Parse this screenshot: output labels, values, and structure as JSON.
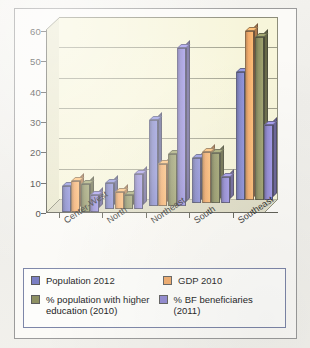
{
  "chart_data": {
    "type": "bar",
    "title": "",
    "xlabel": "",
    "ylabel": "",
    "ylim": [
      0,
      60
    ],
    "yticks": [
      0,
      10,
      20,
      30,
      40,
      50,
      60
    ],
    "grid": true,
    "legend_position": "bottom",
    "categories": [
      "Center-West",
      "North",
      "Northeast",
      "South",
      "Southeast"
    ],
    "series": [
      {
        "name": "Population 2012",
        "color": "#7b7fc4",
        "values": [
          8.5,
          8.5,
          28.5,
          15,
          42.5
        ]
      },
      {
        "name": "GDP 2010",
        "color": "#f0a868",
        "values": [
          10,
          5.5,
          14,
          17,
          56
        ]
      },
      {
        "name": "% population with higher education (2010)",
        "color": "#8e9163",
        "values": [
          9,
          4.5,
          17,
          16.5,
          54
        ]
      },
      {
        "name": "% BF beneficiaries (2011)",
        "color": "#8e86d0",
        "values": [
          5.5,
          11.5,
          52,
          8.5,
          25
        ]
      }
    ]
  },
  "legend": {
    "items": [
      {
        "label": "Population 2012",
        "color": "#7b7fc4"
      },
      {
        "label": "GDP 2010",
        "color": "#f0a868"
      },
      {
        "label": "% population with higher education (2010)",
        "color": "#8e9163"
      },
      {
        "label": "% BF beneficiaries (2011)",
        "color": "#8e86d0"
      }
    ]
  },
  "colors": {
    "plot_background": "#f7f5da",
    "figure_background": "#fbfaf7",
    "gridline": "#8d8d7a",
    "axis": "#5a5a50",
    "legend_border": "#7d86a8"
  }
}
